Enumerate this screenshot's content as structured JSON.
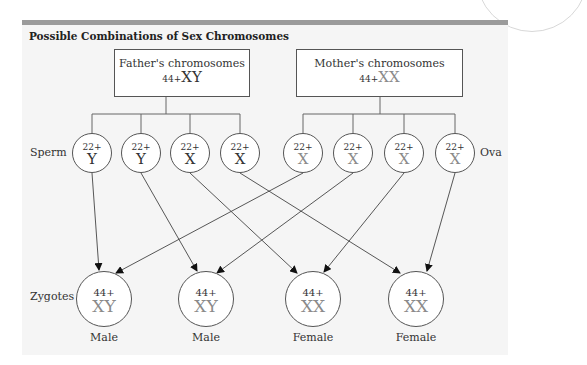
{
  "title": "Possible Combinations of Sex Chromosomes",
  "colors": {
    "panel_bg": "#f5f5f5",
    "top_bar": "#9b9b9b",
    "stroke": "#555555",
    "text_dark": "#333333",
    "text_gray": "#8a8a8a"
  },
  "father": {
    "label": "Father's chromosomes",
    "autosomes": "44+",
    "sex": "XY"
  },
  "mother": {
    "label": "Mother's chromosomes",
    "autosomes": "44+",
    "sex": "XX"
  },
  "row_labels": {
    "sperm": "Sperm",
    "ova": "Ova",
    "zygotes": "Zygotes"
  },
  "sperm": [
    {
      "autosomes": "22+",
      "sex": "Y"
    },
    {
      "autosomes": "22+",
      "sex": "Y"
    },
    {
      "autosomes": "22+",
      "sex": "X"
    },
    {
      "autosomes": "22+",
      "sex": "X"
    }
  ],
  "ova": [
    {
      "autosomes": "22+",
      "sex": "X"
    },
    {
      "autosomes": "22+",
      "sex": "X"
    },
    {
      "autosomes": "22+",
      "sex": "X"
    },
    {
      "autosomes": "22+",
      "sex": "X"
    }
  ],
  "zygotes": [
    {
      "autosomes": "44+",
      "sex": "XY",
      "label": "Male"
    },
    {
      "autosomes": "44+",
      "sex": "XY",
      "label": "Male"
    },
    {
      "autosomes": "44+",
      "sex": "XX",
      "label": "Female"
    },
    {
      "autosomes": "44+",
      "sex": "XX",
      "label": "Female"
    }
  ],
  "connections": [
    {
      "from": "sperm-1",
      "to": "zygote-1"
    },
    {
      "from": "sperm-2",
      "to": "zygote-2"
    },
    {
      "from": "sperm-3",
      "to": "zygote-3"
    },
    {
      "from": "sperm-4",
      "to": "zygote-4"
    },
    {
      "from": "ova-1",
      "to": "zygote-1"
    },
    {
      "from": "ova-2",
      "to": "zygote-2"
    },
    {
      "from": "ova-3",
      "to": "zygote-3"
    },
    {
      "from": "ova-4",
      "to": "zygote-4"
    }
  ]
}
